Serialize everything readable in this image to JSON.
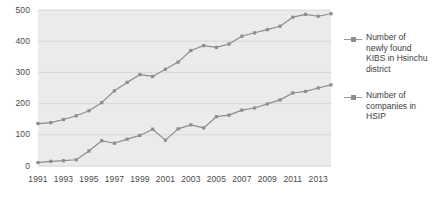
{
  "chart_data": {
    "type": "line",
    "title": "",
    "xlabel": "",
    "ylabel": "",
    "xlim": [
      1991,
      2014
    ],
    "ylim": [
      0,
      500
    ],
    "grid": true,
    "legend_position": "right",
    "x": [
      1991,
      1992,
      1993,
      1994,
      1995,
      1996,
      1997,
      1998,
      1999,
      2000,
      2001,
      2002,
      2003,
      2004,
      2005,
      2006,
      2007,
      2008,
      2009,
      2010,
      2011,
      2012,
      2013,
      2014
    ],
    "x_tick_labels": [
      "1991",
      "1993",
      "1995",
      "1997",
      "1999",
      "2001",
      "2003",
      "2005",
      "2007",
      "2009",
      "2011",
      "2013"
    ],
    "x_ticks": [
      1991,
      1993,
      1995,
      1997,
      1999,
      2001,
      2003,
      2005,
      2007,
      2009,
      2011,
      2013
    ],
    "y_tick_labels": [
      "0",
      "100",
      "200",
      "300",
      "400",
      "500"
    ],
    "y_ticks": [
      0,
      100,
      200,
      300,
      400,
      500
    ],
    "series": [
      {
        "name": "Number of newly found KIBS in Hsinchu district",
        "color": "#8d8d8d",
        "values": [
          136,
          139,
          149,
          161,
          177,
          203,
          241,
          268,
          293,
          287,
          310,
          333,
          370,
          386,
          380,
          391,
          416,
          427,
          437,
          448,
          477,
          486,
          480,
          488
        ]
      },
      {
        "name": "Number of companies in HSIP",
        "color": "#8d8d8d",
        "values": [
          11,
          15,
          17,
          20,
          48,
          81,
          73,
          86,
          98,
          118,
          83,
          119,
          132,
          122,
          158,
          163,
          179,
          186,
          199,
          212,
          234,
          239,
          250,
          260
        ]
      }
    ]
  },
  "legend": {
    "entries": [
      {
        "label": "Number of\nnewly found\nKIBS in Hsinchu\ndistrict"
      },
      {
        "label": "Number of\ncompanies in\nHSIP"
      }
    ]
  },
  "colors": {
    "plot_background": "#ebebeb",
    "gridline": "#d2d2d2",
    "line": "#8d8d8d",
    "marker": "#8d8d8d",
    "text": "#4a4a4a"
  }
}
